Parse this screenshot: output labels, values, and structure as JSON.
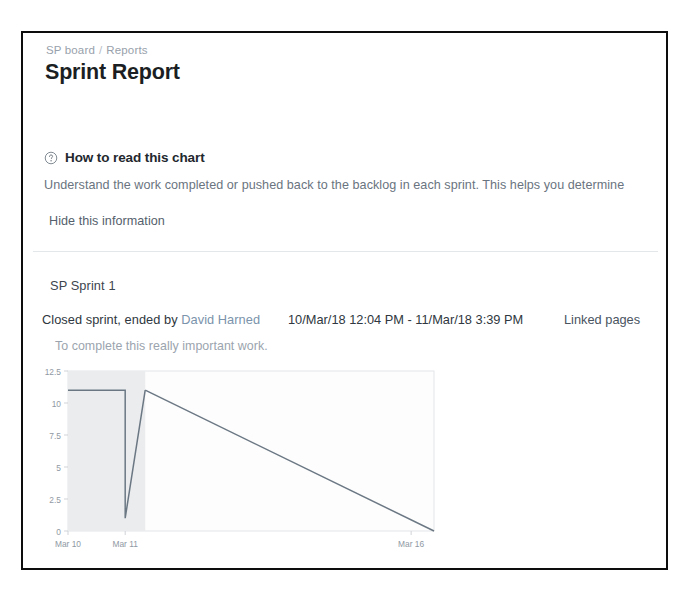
{
  "breadcrumb": {
    "board": "SP board",
    "separator": "/",
    "section": "Reports"
  },
  "page_title": "Sprint Report",
  "help": {
    "icon": "question-circle-icon",
    "heading": "How to read this chart",
    "body": "Understand the work completed or pushed back to the backlog in each sprint. This helps you determine",
    "hide_link": "Hide this information"
  },
  "sprint": {
    "name": "SP Sprint 1",
    "status_prefix": "Closed sprint, ended by ",
    "author": "David Harned",
    "date_range": "10/Mar/18 12:04 PM - 11/Mar/18 3:39 PM",
    "linked_pages": "Linked pages",
    "goal": "To complete this really important work."
  },
  "colors": {
    "guideline": "#6b7884",
    "plot_shade": "#ebecee",
    "axis_text": "#8f99a3",
    "frame": "#0d0d0d",
    "link": "#7b93ab"
  },
  "chart_data": {
    "type": "line",
    "title": "",
    "xlabel": "",
    "ylabel": "",
    "grid": false,
    "legend": "none",
    "ylim": [
      0,
      12.5
    ],
    "yticks": [
      "0",
      "2.5",
      "5",
      "7.5",
      "10",
      "12.5"
    ],
    "ytick_values": [
      0,
      2.5,
      5,
      7.5,
      10,
      12.5
    ],
    "xticks": [
      "Mar 10",
      "Mar 11",
      "Mar 16"
    ],
    "xtick_values": [
      0,
      1,
      6
    ],
    "xlim": [
      0,
      6.4
    ],
    "sprint_shade_end": 1.35,
    "series": [
      {
        "name": "Remaining values",
        "type": "step",
        "x": [
          0,
          1,
          1,
          1.35
        ],
        "values": [
          11,
          11,
          1,
          11
        ]
      },
      {
        "name": "Guideline",
        "type": "line",
        "x": [
          1.35,
          6.4
        ],
        "values": [
          11,
          0
        ]
      }
    ]
  }
}
